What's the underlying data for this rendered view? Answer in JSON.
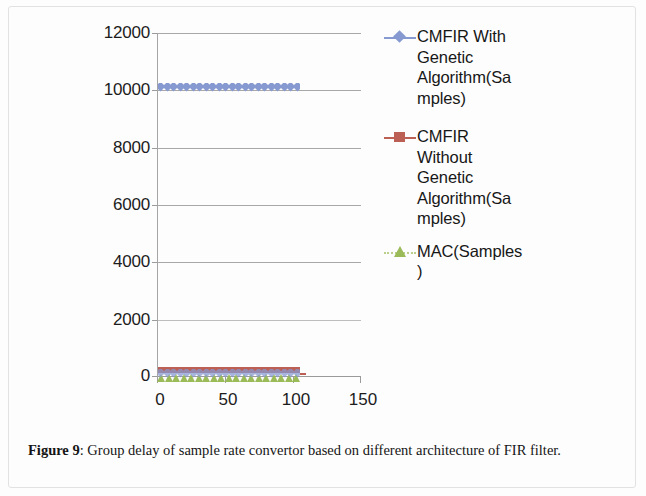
{
  "figure": {
    "caption_label": "Figure 9",
    "caption_sep": ": ",
    "caption_text": "Group delay of sample rate convertor based on different architecture of FIR filter."
  },
  "chart_data": {
    "type": "scatter",
    "title": "",
    "xlabel": "",
    "ylabel": "",
    "xlim": [
      0,
      150
    ],
    "ylim": [
      0,
      12000
    ],
    "grid": true,
    "legend_position": "right",
    "x_ticks": [
      "0",
      "50",
      "100",
      "150"
    ],
    "x_tick_values": [
      0,
      50,
      100,
      150
    ],
    "y_ticks": [
      "0",
      "2000",
      "4000",
      "6000",
      "8000",
      "10000",
      "12000"
    ],
    "y_tick_values": [
      0,
      2000,
      4000,
      6000,
      8000,
      10000,
      12000
    ],
    "series": [
      {
        "name": "CMFIR With Genetic Algorithm(Samples)",
        "legend_lines": [
          "CMFIR With",
          "Genetic",
          "Algorithm(Sa",
          "mples)"
        ],
        "color": "#8699D1",
        "marker": "diamond",
        "line_style": "solid",
        "x_start": 0,
        "x_end": 105,
        "value": 10200,
        "n_points": 105,
        "description": "Constant band of diamond markers at approximately 10200 samples from x=0 to x=105"
      },
      {
        "name": "CMFIR Without Genetic Algorithm(Samples)",
        "legend_lines": [
          "CMFIR",
          "Without",
          "Genetic",
          "Algorithm(Sa",
          "mples)"
        ],
        "color": "#BC6055",
        "marker": "square",
        "line_style": "solid",
        "x_start": 0,
        "x_end": 105,
        "value": 150,
        "n_points": 105,
        "description": "Constant band of square markers just above zero from x=0 to x=105"
      },
      {
        "name": "MAC(Samples)",
        "legend_lines": [
          "MAC(Samples",
          ")"
        ],
        "color": "#9BBB59",
        "marker": "triangle",
        "line_style": "dotted",
        "x_start": 0,
        "x_end": 105,
        "value": 40,
        "n_points": 105,
        "description": "Constant band of triangle markers at the baseline from x=0 to x=105"
      }
    ]
  }
}
